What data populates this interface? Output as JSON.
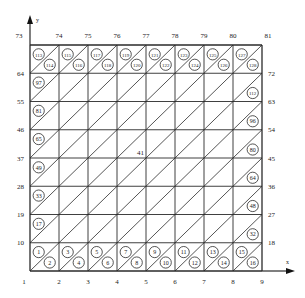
{
  "diagram": {
    "type": "triangulated-mesh",
    "grid": {
      "cols": 8,
      "rows": 8,
      "left": 30,
      "right": 262,
      "top": 45,
      "bottom": 271,
      "diagonal": "bottom-left-to-top-right"
    },
    "axes": {
      "x_label": "x",
      "y_label": "y"
    },
    "node_labels": {
      "bottom": [
        "1",
        "2",
        "3",
        "4",
        "5",
        "6",
        "7",
        "8",
        "9"
      ],
      "top": [
        "73",
        "74",
        "75",
        "76",
        "77",
        "78",
        "79",
        "80",
        "81"
      ],
      "left": [
        "10",
        "19",
        "28",
        "37",
        "46",
        "55",
        "64"
      ],
      "right": [
        "18",
        "27",
        "36",
        "45",
        "54",
        "63",
        "72"
      ],
      "center": "41"
    },
    "element_labels": {
      "bottom_row": [
        {
          "col": 0,
          "upper": "1",
          "lower": "2"
        },
        {
          "col": 1,
          "upper": "3",
          "lower": "4"
        },
        {
          "col": 2,
          "upper": "5",
          "lower": "6"
        },
        {
          "col": 3,
          "upper": "7",
          "lower": "8"
        },
        {
          "col": 4,
          "upper": "9",
          "lower": "10"
        },
        {
          "col": 5,
          "upper": "11",
          "lower": "12"
        },
        {
          "col": 6,
          "upper": "13",
          "lower": "14"
        },
        {
          "col": 7,
          "upper": "15",
          "lower": "16"
        }
      ],
      "top_row": [
        {
          "col": 0,
          "upper": "113",
          "lower": "114"
        },
        {
          "col": 1,
          "upper": "115",
          "lower": "116"
        },
        {
          "col": 2,
          "upper": "117",
          "lower": "118"
        },
        {
          "col": 3,
          "upper": "119",
          "lower": "120"
        },
        {
          "col": 4,
          "upper": "121",
          "lower": "122"
        },
        {
          "col": 5,
          "upper": "123",
          "lower": "124"
        },
        {
          "col": 6,
          "upper": "125",
          "lower": "126"
        },
        {
          "col": 7,
          "upper": "127",
          "lower": "128"
        }
      ],
      "left_column": [
        {
          "row": 1,
          "upper": "17"
        },
        {
          "row": 2,
          "upper": "33"
        },
        {
          "row": 3,
          "upper": "49"
        },
        {
          "row": 4,
          "upper": "65"
        },
        {
          "row": 5,
          "upper": "81"
        },
        {
          "row": 6,
          "upper": "97"
        }
      ],
      "right_column": [
        {
          "row": 1,
          "lower": "32"
        },
        {
          "row": 2,
          "lower": "48"
        },
        {
          "row": 3,
          "lower": "64"
        },
        {
          "row": 4,
          "lower": "80"
        },
        {
          "row": 5,
          "lower": "96"
        },
        {
          "row": 6,
          "lower": "112"
        }
      ]
    },
    "colors": {
      "line": "#2a2a2a",
      "text": "#222222",
      "background": "#ffffff"
    }
  }
}
